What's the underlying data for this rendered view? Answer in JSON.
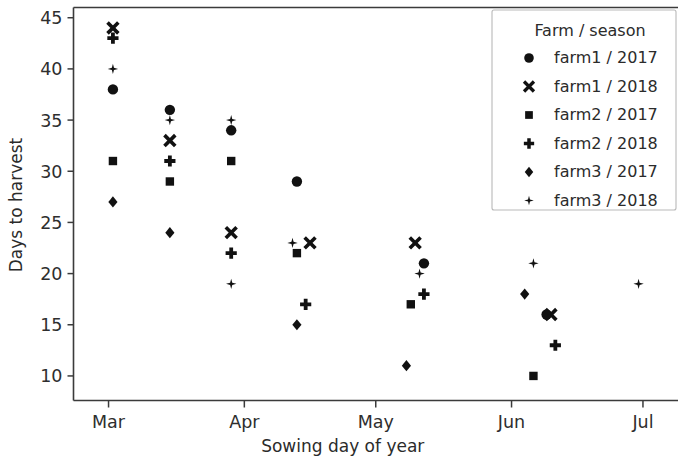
{
  "chart_data": {
    "type": "scatter",
    "title": "",
    "xlabel": "Sowing day of year",
    "ylabel": "Days to harvest",
    "grid": false,
    "legend_position": "upper right",
    "legend_title": "Farm / season",
    "xlim": [
      52,
      190
    ],
    "ylim": [
      7.6,
      46.0
    ],
    "x_ticks": [
      60,
      91,
      121,
      152,
      182
    ],
    "x_tick_labels": [
      "Mar",
      "Apr",
      "May",
      "Jun",
      "Jul"
    ],
    "y_ticks": [
      10,
      15,
      20,
      25,
      30,
      35,
      40,
      45
    ],
    "y_tick_labels": [
      "10",
      "15",
      "20",
      "25",
      "30",
      "35",
      "40",
      "45"
    ],
    "series": [
      {
        "name": "farm1 / 2017",
        "marker": "circle",
        "color": "#111111",
        "points": [
          {
            "x": 61,
            "y": 38
          },
          {
            "x": 74,
            "y": 36
          },
          {
            "x": 88,
            "y": 34
          },
          {
            "x": 103,
            "y": 29
          },
          {
            "x": 132,
            "y": 21
          },
          {
            "x": 160,
            "y": 16
          }
        ]
      },
      {
        "name": "farm1 / 2018",
        "marker": "x",
        "color": "#111111",
        "points": [
          {
            "x": 61,
            "y": 44
          },
          {
            "x": 74,
            "y": 33
          },
          {
            "x": 88,
            "y": 24
          },
          {
            "x": 106,
            "y": 23
          },
          {
            "x": 130,
            "y": 23
          },
          {
            "x": 161,
            "y": 16
          }
        ]
      },
      {
        "name": "farm2 / 2017",
        "marker": "square",
        "color": "#111111",
        "points": [
          {
            "x": 61,
            "y": 31
          },
          {
            "x": 74,
            "y": 29
          },
          {
            "x": 88,
            "y": 31
          },
          {
            "x": 103,
            "y": 22
          },
          {
            "x": 129,
            "y": 17
          },
          {
            "x": 157,
            "y": 10
          }
        ]
      },
      {
        "name": "farm2 / 2018",
        "marker": "plus",
        "color": "#111111",
        "points": [
          {
            "x": 61,
            "y": 43
          },
          {
            "x": 74,
            "y": 31
          },
          {
            "x": 88,
            "y": 22
          },
          {
            "x": 105,
            "y": 17
          },
          {
            "x": 132,
            "y": 18
          },
          {
            "x": 162,
            "y": 13
          }
        ]
      },
      {
        "name": "farm3 / 2017",
        "marker": "diamond",
        "color": "#111111",
        "points": [
          {
            "x": 61,
            "y": 27
          },
          {
            "x": 74,
            "y": 24
          },
          {
            "x": 103,
            "y": 15
          },
          {
            "x": 128,
            "y": 11
          },
          {
            "x": 155,
            "y": 18
          }
        ]
      },
      {
        "name": "farm3 / 2018",
        "marker": "star",
        "color": "#111111",
        "points": [
          {
            "x": 61,
            "y": 40
          },
          {
            "x": 74,
            "y": 35
          },
          {
            "x": 88,
            "y": 35
          },
          {
            "x": 88,
            "y": 19
          },
          {
            "x": 102,
            "y": 23
          },
          {
            "x": 131,
            "y": 20
          },
          {
            "x": 157,
            "y": 21
          },
          {
            "x": 181,
            "y": 19
          }
        ]
      }
    ]
  },
  "legend": {
    "title": "Farm / season",
    "entries": [
      {
        "label": "farm1 / 2017",
        "marker": "circle"
      },
      {
        "label": "farm1 / 2018",
        "marker": "x"
      },
      {
        "label": "farm2 / 2017",
        "marker": "square"
      },
      {
        "label": "farm2 / 2018",
        "marker": "plus"
      },
      {
        "label": "farm3 / 2017",
        "marker": "diamond"
      },
      {
        "label": "farm3 / 2018",
        "marker": "star"
      }
    ]
  },
  "axes": {
    "xlabel": "Sowing day of year",
    "ylabel": "Days to harvest",
    "x_tick_labels": [
      "Mar",
      "Apr",
      "May",
      "Jun",
      "Jul"
    ],
    "y_tick_labels": [
      "45",
      "40",
      "35",
      "30",
      "25",
      "20",
      "15",
      "10"
    ]
  }
}
